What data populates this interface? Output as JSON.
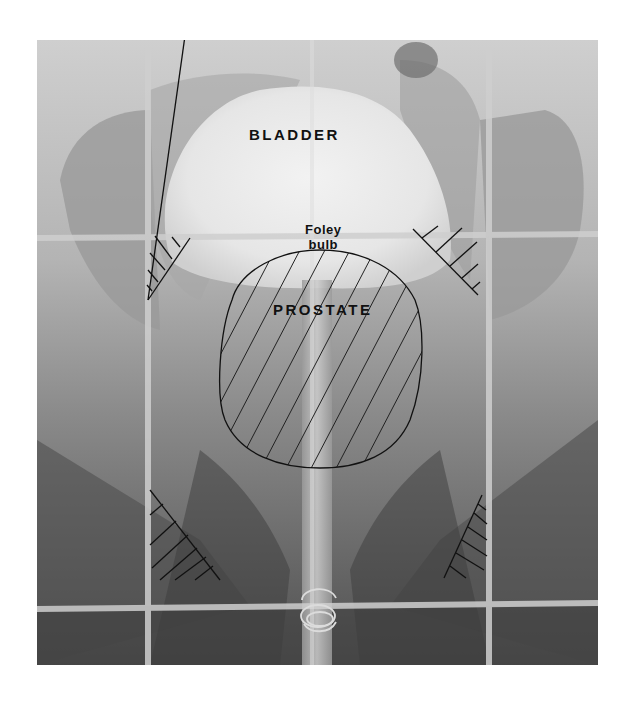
{
  "figure": {
    "type": "radiograph",
    "colors": {
      "background": "#ffffff",
      "film_light": "#d8d8d8",
      "film_dark": "#4a4a4a",
      "grid_line": "#c8c8c8",
      "annotation_ink": "#111111"
    }
  },
  "labels": {
    "bladder": "BLADDER",
    "foley_line1": "Foley",
    "foley_line2": "bulb",
    "prostate": "PROSTATE"
  },
  "grid": {
    "vertical_lines_x": [
      148,
      312,
      489
    ],
    "horizontal_lines_y": [
      238,
      606
    ]
  },
  "annotations": [
    {
      "name": "prostate-outline",
      "shape": "hatched-circle",
      "center": [
        319,
        359
      ],
      "rx": 100,
      "ry": 108
    },
    {
      "name": "hatch-top-left",
      "shape": "hatched-triangle"
    },
    {
      "name": "hatch-top-right",
      "shape": "hatched-triangle"
    },
    {
      "name": "hatch-bottom-left",
      "shape": "hatched-triangle"
    },
    {
      "name": "hatch-bottom-right",
      "shape": "hatched-triangle"
    },
    {
      "name": "catheter-tube",
      "shape": "vertical-tube"
    },
    {
      "name": "coil-marker",
      "shape": "coil"
    }
  ]
}
